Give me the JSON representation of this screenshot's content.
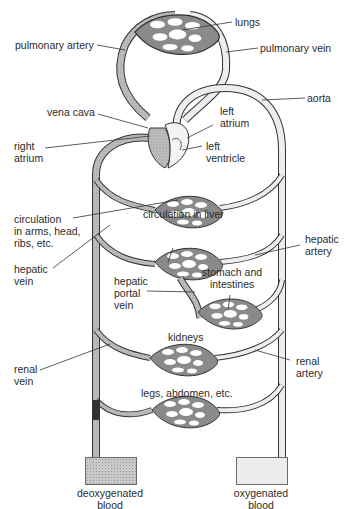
{
  "diagram": {
    "labels": {
      "lungs": "lungs",
      "pulmonary_artery": "pulmonary artery",
      "pulmonary_vein": "pulmonary vein",
      "vena_cava": "vena cava",
      "aorta": "aorta",
      "left_atrium": [
        "left",
        "atrium"
      ],
      "right_atrium": [
        "right",
        "atrium"
      ],
      "left_ventricle": [
        "left",
        "ventricle"
      ],
      "circulation_arms": [
        "circulation",
        "in arms, head,",
        "ribs, etc."
      ],
      "circulation_liver": "circulation in liver",
      "hepatic_artery": [
        "hepatic",
        "artery"
      ],
      "hepatic_vein": [
        "hepatic",
        "vein"
      ],
      "hepatic_portal_vein": [
        "hepatic",
        "portal",
        "vein"
      ],
      "stomach_intestines": [
        "stomach and",
        "intestines"
      ],
      "kidneys": "kidneys",
      "renal_vein": [
        "renal",
        "vein"
      ],
      "renal_artery": [
        "renal",
        "artery"
      ],
      "legs_abdomen": "legs, abdomen, etc."
    },
    "legend": [
      {
        "label": [
          "deoxygenated",
          "blood"
        ],
        "fill": "#c9c9c9"
      },
      {
        "label": [
          "oxygenated",
          "blood"
        ],
        "fill": "#ececec"
      }
    ],
    "colors": {
      "vessel_outline": "#3a3a3a",
      "deoxygenated": "#b5b5b5",
      "oxygenated": "#eeeeee",
      "leader_line": "#333333"
    }
  }
}
